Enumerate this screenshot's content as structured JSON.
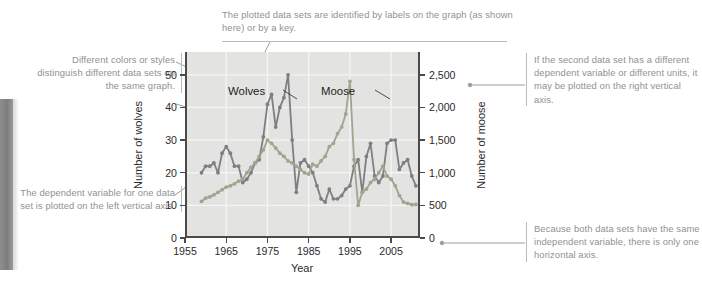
{
  "figure": {
    "kind": "annotated-double-line-graph"
  },
  "colors": {
    "wolves_series": "#7d7f84",
    "moose_series": "#9fa58f",
    "plot_background": "#e3e3e1",
    "gridline": "#f4f4f2",
    "axis": "#4a4a4a",
    "callout_text": "#8f9193",
    "callout_rule": "#b9bbbd",
    "leader_line": "#9b9d9f",
    "page_gutter": "#7d7d7d"
  },
  "callouts": {
    "top": {
      "text": "The plotted data sets are identified by labels on the graph (as shown here) or by a key."
    },
    "left_top": {
      "text": "Different colors or styles distinguish different data sets on the same graph."
    },
    "left_bottom": {
      "text": "The dependent variable for one data set is plotted on the left vertical axis."
    },
    "right_top": {
      "text": "If the second data set has a different dependent variable or different units, it may be plotted on the right vertical axis."
    },
    "right_bottom": {
      "text": "Because both data sets have the same independent variable, there is only one horizontal axis."
    }
  },
  "chart_data": {
    "type": "line",
    "title": "",
    "xlabel": "Year",
    "ylabel": "Number of wolves",
    "y2label": "Number of moose",
    "grid": true,
    "legend_position": "in-plot-labels",
    "xlim": [
      1955,
      2012
    ],
    "xticks": [
      1955,
      1965,
      1975,
      1985,
      1995,
      2005
    ],
    "xticklabels": [
      "1955",
      "1965",
      "1975",
      "1985",
      "1995",
      "2005"
    ],
    "ylim": [
      0,
      57
    ],
    "yticks": [
      0,
      10,
      20,
      30,
      40,
      50
    ],
    "yticklabels": [
      "0",
      "10",
      "20",
      "30",
      "40",
      "50"
    ],
    "y2lim": [
      0,
      2850
    ],
    "y2ticks": [
      0,
      500,
      1000,
      1500,
      2000,
      2500
    ],
    "y2ticklabels": [
      "0",
      "500",
      "1,000",
      "1,500",
      "2,000",
      "2,500"
    ],
    "series": [
      {
        "name": "Wolves",
        "axis": "left",
        "color": "#7d7f84",
        "marker": "circle",
        "x": [
          1959,
          1960,
          1961,
          1962,
          1963,
          1964,
          1965,
          1966,
          1967,
          1968,
          1969,
          1970,
          1971,
          1972,
          1973,
          1974,
          1975,
          1976,
          1977,
          1978,
          1979,
          1980,
          1981,
          1982,
          1983,
          1984,
          1985,
          1986,
          1987,
          1988,
          1989,
          1990,
          1991,
          1992,
          1993,
          1994,
          1995,
          1996,
          1997,
          1998,
          1999,
          2000,
          2001,
          2002,
          2003,
          2004,
          2005,
          2006,
          2007,
          2008,
          2009,
          2010,
          2011
        ],
        "values": [
          20,
          22,
          22,
          23,
          20,
          26,
          28,
          26,
          22,
          22,
          17,
          18,
          20,
          23,
          24,
          31,
          41,
          44,
          34,
          40,
          43,
          50,
          30,
          14,
          23,
          24,
          22,
          20,
          16,
          12,
          11,
          15,
          12,
          12,
          13,
          15,
          16,
          22,
          24,
          14,
          25,
          29,
          19,
          17,
          19,
          29,
          30,
          30,
          21,
          23,
          24,
          19,
          16
        ]
      },
      {
        "name": "Moose",
        "axis": "right",
        "color": "#9fa58f",
        "marker": "circle",
        "x": [
          1959,
          1960,
          1961,
          1962,
          1963,
          1964,
          1965,
          1966,
          1967,
          1968,
          1969,
          1970,
          1971,
          1972,
          1973,
          1974,
          1975,
          1976,
          1977,
          1978,
          1979,
          1980,
          1981,
          1982,
          1983,
          1984,
          1985,
          1986,
          1987,
          1988,
          1989,
          1990,
          1991,
          1992,
          1993,
          1994,
          1995,
          1996,
          1997,
          1998,
          1999,
          2000,
          2001,
          2002,
          2003,
          2004,
          2005,
          2006,
          2007,
          2008,
          2009,
          2010,
          2011
        ],
        "values": [
          560,
          610,
          630,
          660,
          700,
          740,
          780,
          800,
          830,
          870,
          900,
          1000,
          1080,
          1150,
          1250,
          1350,
          1500,
          1450,
          1380,
          1300,
          1250,
          1180,
          1150,
          1100,
          1050,
          1000,
          980,
          1130,
          1100,
          1180,
          1250,
          1400,
          1450,
          1600,
          1700,
          1900,
          2400,
          1200,
          500,
          700,
          750,
          850,
          900,
          1000,
          1100,
          950,
          900,
          800,
          650,
          550,
          530,
          510,
          515
        ]
      }
    ],
    "in_plot_labels": [
      {
        "text": "Wolves"
      },
      {
        "text": "Moose"
      }
    ]
  }
}
